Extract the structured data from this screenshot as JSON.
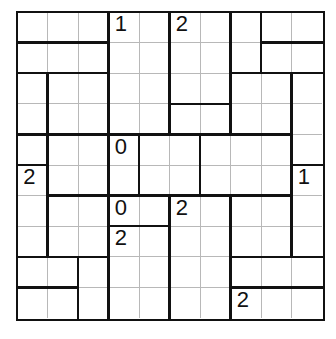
{
  "puzzle": {
    "rows": 10,
    "cols": 10,
    "clues": [
      {
        "r": 0,
        "c": 3,
        "v": "1"
      },
      {
        "r": 0,
        "c": 5,
        "v": "2"
      },
      {
        "r": 4,
        "c": 3,
        "v": "0"
      },
      {
        "r": 5,
        "c": 0,
        "v": "2"
      },
      {
        "r": 5,
        "c": 9,
        "v": "1"
      },
      {
        "r": 6,
        "c": 3,
        "v": "0"
      },
      {
        "r": 6,
        "c": 5,
        "v": "2"
      },
      {
        "r": 7,
        "c": 3,
        "v": "2"
      },
      {
        "r": 9,
        "c": 7,
        "v": "2"
      }
    ],
    "vertical_thick": [
      [
        3,
        5,
        7,
        8
      ],
      [
        3,
        5,
        7,
        8
      ],
      [
        1,
        3,
        5,
        7,
        9
      ],
      [
        1,
        3,
        5,
        7,
        9
      ],
      [
        1,
        3,
        4,
        6,
        9
      ],
      [
        1,
        3,
        4,
        6,
        9
      ],
      [
        1,
        3,
        5,
        7,
        9
      ],
      [
        1,
        3,
        5,
        7,
        9
      ],
      [
        2,
        3,
        5,
        7
      ],
      [
        2,
        3,
        5,
        7
      ]
    ],
    "horizontal_thick": [
      [],
      [
        0,
        1,
        2,
        8,
        9
      ],
      [
        0,
        1,
        2,
        7,
        8,
        9
      ],
      [
        5,
        6
      ],
      [
        0,
        1,
        2,
        3,
        4,
        5,
        6,
        7,
        8
      ],
      [
        0,
        9
      ],
      [
        1,
        2,
        3,
        4,
        5,
        6,
        7,
        8
      ],
      [
        3,
        4
      ],
      [
        0,
        1,
        2,
        7,
        8,
        9
      ],
      [
        0,
        1,
        7,
        8,
        9
      ]
    ],
    "colors": {
      "line": "#111111",
      "grid": "#b8b8b8",
      "background": "#ffffff"
    }
  }
}
